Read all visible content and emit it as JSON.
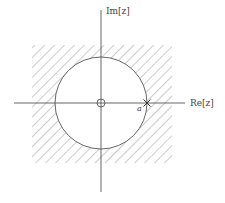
{
  "diagram": {
    "axes": {
      "imaginary_label": "Im[z]",
      "real_label": "Re[z]"
    },
    "point_label": "a",
    "marks": {
      "origin": "circle-marker",
      "point_a": "cross-marker"
    },
    "regions": {
      "hatched": "square region outside the circle",
      "unit_circle": "circle centered at origin passing through a"
    },
    "colors": {
      "line": "#555555",
      "hatch": "#9a9a9a",
      "background": "#ffffff"
    }
  }
}
